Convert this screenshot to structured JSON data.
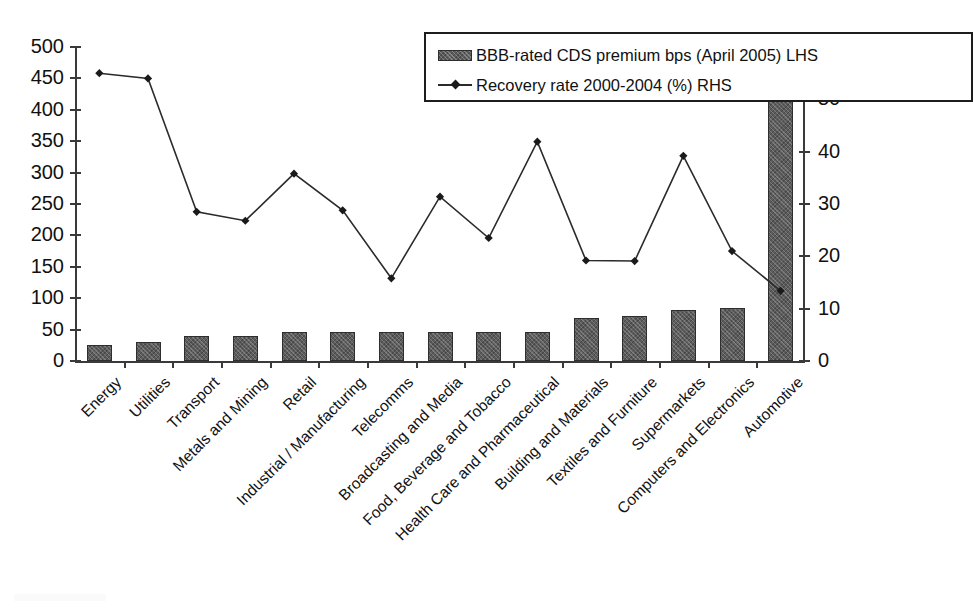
{
  "chart_data": {
    "type": "bar",
    "title": "",
    "xlabel": "",
    "categories": [
      "Energy",
      "Utilities",
      "Transport",
      "Metals and Mining",
      "Retail",
      "Industrial / Manufacturing",
      "Telecomms",
      "Broadcasting and Media",
      "Food, Beverage and Tobacco",
      "Health Care and Pharmaceutical",
      "Building and Materials",
      "Textiles and Furniture",
      "Supermarkets",
      "Computers and Electronics",
      "Automotive"
    ],
    "series": [
      {
        "name": "BBB-rated CDS premium bps (April 2005) LHS",
        "type": "bar",
        "axis": "left",
        "values": [
          26,
          30,
          40,
          40,
          46,
          46,
          46,
          46,
          46,
          46,
          68,
          72,
          82,
          84,
          444
        ]
      },
      {
        "name": "Recovery rate 2000-2004 (%) RHS",
        "type": "line",
        "axis": "right",
        "marker": "diamond",
        "values": [
          55,
          54,
          28.5,
          26.8,
          35.8,
          28.8,
          15.8,
          31.4,
          23.5,
          41.9,
          19.2,
          19.1,
          39.2,
          21.0,
          13.4
        ]
      }
    ],
    "left_axis": {
      "label": "",
      "ylim": [
        0,
        500
      ],
      "ticks": [
        0,
        50,
        100,
        150,
        200,
        250,
        300,
        350,
        400,
        450,
        500
      ]
    },
    "right_axis": {
      "label": "",
      "ylim": [
        0,
        60
      ],
      "ticks": [
        0,
        10,
        20,
        30,
        40,
        50,
        60
      ]
    },
    "grid": false,
    "legend": {
      "position": "top-right",
      "entries": [
        {
          "label": "BBB-rated CDS premium bps (April 2005) LHS",
          "marker": "bar-swatch"
        },
        {
          "label": "Recovery rate 2000-2004 (%) RHS",
          "marker": "line-diamond"
        }
      ]
    },
    "colors": {
      "bar_fill": "#5c5c5c",
      "bar_edge": "#2e2e2e",
      "line": "#2b2b2b",
      "axis": "#3a3a3a",
      "text": "#111111",
      "background": "#ffffff"
    }
  }
}
